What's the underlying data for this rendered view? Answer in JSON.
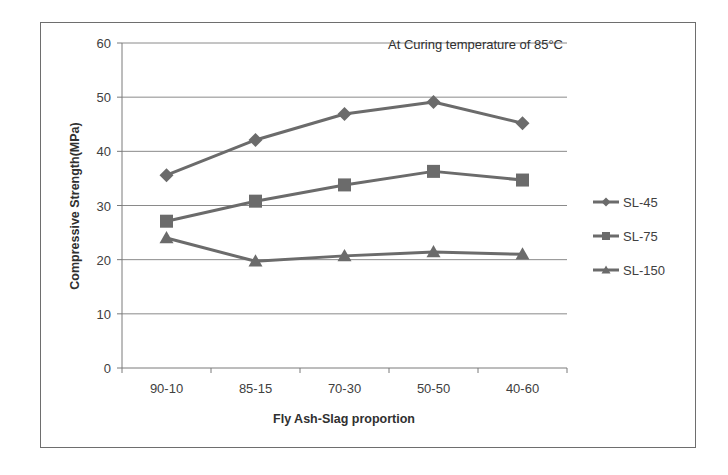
{
  "chart_data": {
    "type": "line",
    "title": "",
    "annotation": "At Curing temperature of 85°C",
    "xlabel": "Fly Ash-Slag proportion",
    "ylabel": "Compressive Strength(MPa)",
    "categories": [
      "90-10",
      "85-15",
      "70-30",
      "50-50",
      "40-60"
    ],
    "ylim": [
      0,
      60
    ],
    "yticks": [
      0,
      10,
      20,
      30,
      40,
      50,
      60
    ],
    "grid": true,
    "legend_position": "right",
    "series": [
      {
        "name": "SL-45",
        "marker": "diamond",
        "values": [
          35.6,
          42.1,
          46.9,
          49.1,
          45.2
        ]
      },
      {
        "name": "SL-75",
        "marker": "square",
        "values": [
          27.1,
          30.8,
          33.8,
          36.3,
          34.7
        ]
      },
      {
        "name": "SL-150",
        "marker": "triangle",
        "values": [
          24.0,
          19.7,
          20.7,
          21.4,
          21.0
        ]
      }
    ],
    "colors": {
      "line": "#6b6b6b",
      "grid": "#8a8a8a",
      "axis": "#7a7a7a"
    }
  }
}
